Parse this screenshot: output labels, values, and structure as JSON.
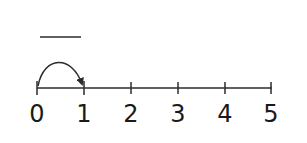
{
  "diagram": {
    "type": "number-line",
    "answer_blank": "",
    "ticks": [
      "0",
      "1",
      "2",
      "3",
      "4",
      "5"
    ],
    "jump": {
      "from": "0",
      "to": "1"
    },
    "colors": {
      "stroke": "#2b2b2b",
      "text": "#1a1a1a"
    }
  }
}
